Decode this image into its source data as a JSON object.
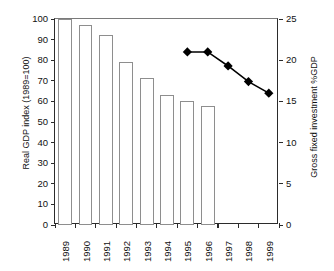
{
  "chart_data": {
    "type": "bar",
    "title": "",
    "subtitle": "",
    "xlabel": "",
    "categories": [
      "1989",
      "1990",
      "1991",
      "1992",
      "1993",
      "1994",
      "1995",
      "1996",
      "1997",
      "1998",
      "1999"
    ],
    "grid": false,
    "legend": "none",
    "axes": {
      "left": {
        "label": "Real GDP index (1989=100)",
        "ylim": [
          0,
          100
        ],
        "ticks": [
          0,
          10,
          20,
          30,
          40,
          50,
          60,
          70,
          80,
          90,
          100
        ],
        "tick_labels": [
          "0",
          "10",
          "20",
          "30",
          "40",
          "50",
          "60",
          "70",
          "80",
          "90",
          "100"
        ]
      },
      "right": {
        "label": "Gross fixed investment %GDP",
        "ylim": [
          0,
          25
        ],
        "ticks": [
          0,
          5,
          10,
          15,
          20,
          25
        ],
        "tick_labels": [
          "0",
          "5",
          "10",
          "15",
          "20",
          "25"
        ]
      }
    },
    "series": [
      {
        "name": "Real GDP index (1989=100)",
        "type": "bar",
        "axis": "left",
        "color": "#ffffff",
        "edge_color": "#8e8e8e",
        "values": [
          100,
          97,
          92,
          79,
          71.5,
          63,
          60,
          58,
          null,
          null,
          null
        ]
      },
      {
        "name": "Gross fixed investment %GDP",
        "type": "line",
        "axis": "right",
        "color": "#000000",
        "marker": "diamond",
        "values": [
          null,
          null,
          null,
          null,
          null,
          null,
          21.0,
          21.0,
          19.3,
          17.4,
          16.0
        ]
      }
    ]
  }
}
